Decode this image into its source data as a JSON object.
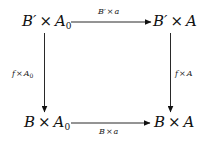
{
  "diagram": {
    "type": "commutative-square",
    "nodes": {
      "top_left": {
        "base": "B′",
        "op": "×",
        "factor": "A",
        "sub": "0"
      },
      "top_right": {
        "base": "B′",
        "op": "×",
        "factor": "A",
        "sub": ""
      },
      "bottom_left": {
        "base": "B",
        "op": "×",
        "factor": "A",
        "sub": "0"
      },
      "bottom_right": {
        "base": "B",
        "op": "×",
        "factor": "A",
        "sub": ""
      }
    },
    "arrows": {
      "top": {
        "from": "top_left",
        "to": "top_right",
        "label_base": "B′",
        "label_op": "×",
        "label_factor": "a",
        "label_sub": ""
      },
      "bottom": {
        "from": "bottom_left",
        "to": "bottom_right",
        "label_base": "B",
        "label_op": "×",
        "label_factor": "a",
        "label_sub": ""
      },
      "left": {
        "from": "top_left",
        "to": "bottom_left",
        "label_base": "f",
        "label_op": "×",
        "label_factor": "A",
        "label_sub": "0"
      },
      "right": {
        "from": "top_right",
        "to": "bottom_right",
        "label_base": "f",
        "label_op": "×",
        "label_factor": "A",
        "label_sub": ""
      }
    },
    "colors": {
      "ink": "#111111",
      "background": "#ffffff"
    }
  }
}
